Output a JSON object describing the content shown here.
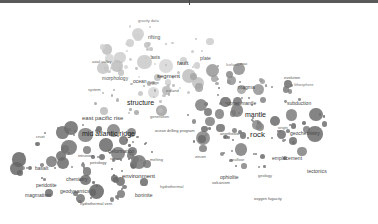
{
  "view": {
    "type": "term co-occurrence map",
    "background": "#ffffff",
    "frame_color": "#5a5a5a"
  },
  "colors": {
    "light": "#c8c8c8",
    "mid": "#a0a0a0",
    "dark": "#7a7a7a",
    "label": "#333333"
  },
  "labels": [
    {
      "text": "gravity data",
      "x": 138,
      "y": 16,
      "size": 4,
      "shade": "#777"
    },
    {
      "text": "rifting",
      "x": 148,
      "y": 32,
      "size": 5,
      "shade": "#555"
    },
    {
      "text": "axis",
      "x": 151,
      "y": 52,
      "size": 5,
      "shade": "#444"
    },
    {
      "text": "fault",
      "x": 177,
      "y": 57,
      "size": 6,
      "shade": "#333"
    },
    {
      "text": "axial valley",
      "x": 92,
      "y": 57,
      "size": 4,
      "shade": "#666"
    },
    {
      "text": "plate",
      "x": 200,
      "y": 53,
      "size": 5,
      "shade": "#555"
    },
    {
      "text": "segment",
      "x": 157,
      "y": 70,
      "size": 6,
      "shade": "#333"
    },
    {
      "text": "morphology",
      "x": 102,
      "y": 73,
      "size": 5,
      "shade": "#555"
    },
    {
      "text": "ocean",
      "x": 133,
      "y": 76,
      "size": 5,
      "shade": "#444"
    },
    {
      "text": "ridge",
      "x": 150,
      "y": 78,
      "size": 4,
      "shade": "#666"
    },
    {
      "text": "iceland",
      "x": 166,
      "y": 86,
      "size": 4,
      "shade": "#666"
    },
    {
      "text": "Iceland",
      "x": 226,
      "y": 60,
      "size": 4,
      "shade": "#777"
    },
    {
      "text": "mac",
      "x": 240,
      "y": 59,
      "size": 4,
      "shade": "#555"
    },
    {
      "text": "system",
      "x": 88,
      "y": 85,
      "size": 4,
      "shade": "#666"
    },
    {
      "text": "structure",
      "x": 127,
      "y": 96,
      "size": 7,
      "shade": "#222"
    },
    {
      "text": "east pacific rise",
      "x": 82,
      "y": 112,
      "size": 6,
      "shade": "#444"
    },
    {
      "text": "generation",
      "x": 150,
      "y": 112,
      "size": 4,
      "shade": "#666"
    },
    {
      "text": "mid atlantic ridge",
      "x": 82,
      "y": 127,
      "size": 7,
      "shade": "#222"
    },
    {
      "text": "ocean drilling program",
      "x": 155,
      "y": 126,
      "size": 4,
      "shade": "#555"
    },
    {
      "text": "magma",
      "x": 238,
      "y": 82,
      "size": 5,
      "shade": "#444"
    },
    {
      "text": "upper mantle",
      "x": 227,
      "y": 98,
      "size": 5,
      "shade": "#444"
    },
    {
      "text": "evolution",
      "x": 284,
      "y": 73,
      "size": 4,
      "shade": "#555"
    },
    {
      "text": "lithosphere",
      "x": 294,
      "y": 80,
      "size": 4,
      "shade": "#777"
    },
    {
      "text": "subduction",
      "x": 287,
      "y": 98,
      "size": 5,
      "shade": "#444"
    },
    {
      "text": "mantle",
      "x": 245,
      "y": 108,
      "size": 7,
      "shade": "#222"
    },
    {
      "text": "rock",
      "x": 250,
      "y": 128,
      "size": 8,
      "shade": "#222"
    },
    {
      "text": "anorthosite",
      "x": 220,
      "y": 129,
      "size": 4,
      "shade": "#555"
    },
    {
      "text": "geochemistry",
      "x": 290,
      "y": 128,
      "size": 5,
      "shade": "#444"
    },
    {
      "text": "origin",
      "x": 278,
      "y": 123,
      "size": 4,
      "shade": "#666"
    },
    {
      "text": "crust",
      "x": 36,
      "y": 132,
      "size": 4,
      "shade": "#555"
    },
    {
      "text": "deformation",
      "x": 108,
      "y": 146,
      "size": 5,
      "shade": "#444"
    },
    {
      "text": "region",
      "x": 110,
      "y": 154,
      "size": 4,
      "shade": "#666"
    },
    {
      "text": "intrusion",
      "x": 78,
      "y": 151,
      "size": 4,
      "shade": "#555"
    },
    {
      "text": "petrology",
      "x": 90,
      "y": 158,
      "size": 4,
      "shade": "#555"
    },
    {
      "text": "melting",
      "x": 150,
      "y": 155,
      "size": 4,
      "shade": "#666"
    },
    {
      "text": "zircon",
      "x": 195,
      "y": 152,
      "size": 4,
      "shade": "#555"
    },
    {
      "text": "seafloor",
      "x": 230,
      "y": 155,
      "size": 4,
      "shade": "#666"
    },
    {
      "text": "emplacement",
      "x": 272,
      "y": 153,
      "size": 5,
      "shade": "#444"
    },
    {
      "text": "environment",
      "x": 122,
      "y": 170,
      "size": 6,
      "shade": "#333"
    },
    {
      "text": "chemistry",
      "x": 66,
      "y": 174,
      "size": 5,
      "shade": "#444"
    },
    {
      "text": "geodynamics",
      "x": 60,
      "y": 186,
      "size": 5,
      "shade": "#444"
    },
    {
      "text": "basalt",
      "x": 35,
      "y": 163,
      "size": 5,
      "shade": "#444"
    },
    {
      "text": "peridotite",
      "x": 36,
      "y": 180,
      "size": 5,
      "shade": "#444"
    },
    {
      "text": "ophiolite",
      "x": 220,
      "y": 172,
      "size": 5,
      "shade": "#444"
    },
    {
      "text": "volcanism",
      "x": 212,
      "y": 178,
      "size": 4,
      "shade": "#555"
    },
    {
      "text": "hydrothermal",
      "x": 160,
      "y": 182,
      "size": 4,
      "shade": "#666"
    },
    {
      "text": "magmatism",
      "x": 25,
      "y": 190,
      "size": 5,
      "shade": "#444"
    },
    {
      "text": "tectonics",
      "x": 307,
      "y": 166,
      "size": 5,
      "shade": "#444"
    },
    {
      "text": "geology",
      "x": 258,
      "y": 171,
      "size": 4,
      "shade": "#666"
    },
    {
      "text": "boninite",
      "x": 135,
      "y": 190,
      "size": 5,
      "shade": "#444"
    },
    {
      "text": "oxygen fugacity",
      "x": 254,
      "y": 194,
      "size": 4,
      "shade": "#555"
    },
    {
      "text": "hydrothermal vent",
      "x": 80,
      "y": 199,
      "size": 4,
      "shade": "#555"
    }
  ]
}
